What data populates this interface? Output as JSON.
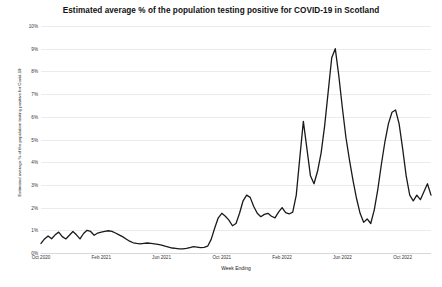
{
  "chart_data": {
    "type": "line",
    "title": "Estimated average % of the population testing positive for COVID-19 in Scotland",
    "xlabel": "Week Ending",
    "ylabel": "Estimated average % of the population testing positive for Covid-19",
    "ylim": [
      0,
      10
    ],
    "ytick_labels": [
      "0%",
      "1%",
      "2%",
      "3%",
      "4%",
      "5%",
      "6%",
      "7%",
      "8%",
      "9%",
      "10%"
    ],
    "ytick_values": [
      0,
      1,
      2,
      3,
      4,
      5,
      6,
      7,
      8,
      9,
      10
    ],
    "xtick_labels": [
      "Oct 2020",
      "Feb 2021",
      "Jun 2021",
      "Oct 2021",
      "Feb 2022",
      "Jun 2022",
      "Oct 2022"
    ],
    "xtick_positions": [
      0,
      17,
      34,
      51,
      68,
      85,
      102
    ],
    "grid": true,
    "legend": false,
    "line_color": "#1a1a1a",
    "line_width": 1.3,
    "x_index_max": 110,
    "series": [
      {
        "name": "Estimated % testing positive",
        "x": [
          0,
          1,
          2,
          3,
          4,
          5,
          6,
          7,
          8,
          9,
          10,
          11,
          12,
          13,
          14,
          15,
          16,
          17,
          18,
          19,
          20,
          21,
          22,
          23,
          24,
          25,
          26,
          27,
          28,
          29,
          30,
          31,
          32,
          33,
          34,
          35,
          36,
          37,
          38,
          39,
          40,
          41,
          42,
          43,
          44,
          45,
          46,
          47,
          48,
          49,
          50,
          51,
          52,
          53,
          54,
          55,
          56,
          57,
          58,
          59,
          60,
          61,
          62,
          63,
          64,
          65,
          66,
          67,
          68,
          69,
          70,
          71,
          72,
          73,
          74,
          75,
          76,
          77,
          78,
          79,
          80,
          81,
          82,
          83,
          84,
          85,
          86,
          87,
          88,
          89,
          90,
          91,
          92,
          93,
          94,
          95,
          96,
          97,
          98,
          99,
          100,
          101,
          102,
          103,
          104,
          105,
          106,
          107,
          108,
          109,
          110
        ],
        "values": [
          0.42,
          0.62,
          0.75,
          0.63,
          0.8,
          0.92,
          0.72,
          0.62,
          0.78,
          0.95,
          0.8,
          0.62,
          0.86,
          1.0,
          0.95,
          0.78,
          0.88,
          0.92,
          0.95,
          0.98,
          0.95,
          0.88,
          0.8,
          0.72,
          0.62,
          0.52,
          0.45,
          0.42,
          0.4,
          0.42,
          0.44,
          0.42,
          0.4,
          0.38,
          0.35,
          0.3,
          0.26,
          0.22,
          0.2,
          0.18,
          0.18,
          0.2,
          0.24,
          0.28,
          0.26,
          0.24,
          0.25,
          0.3,
          0.6,
          1.1,
          1.55,
          1.75,
          1.62,
          1.45,
          1.2,
          1.3,
          1.75,
          2.3,
          2.55,
          2.45,
          2.05,
          1.75,
          1.6,
          1.7,
          1.75,
          1.62,
          1.55,
          1.8,
          2.0,
          1.78,
          1.72,
          1.8,
          2.55,
          4.2,
          5.8,
          4.6,
          3.4,
          3.05,
          3.6,
          4.4,
          5.6,
          7.1,
          8.6,
          9.0,
          7.8,
          6.4,
          5.1,
          4.1,
          3.2,
          2.4,
          1.75,
          1.35,
          1.5,
          1.3,
          1.9,
          2.8,
          3.9,
          4.9,
          5.7,
          6.2,
          6.3,
          5.7,
          4.6,
          3.4,
          2.55,
          2.3,
          2.55,
          2.35,
          2.7,
          3.05,
          2.55
        ]
      }
    ]
  }
}
